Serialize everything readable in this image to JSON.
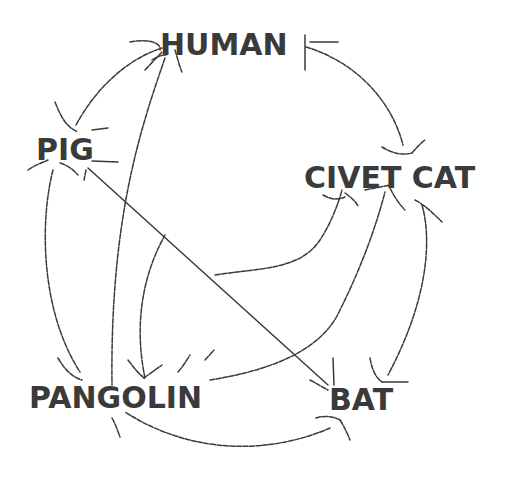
{
  "diagram": {
    "type": "transmission-network",
    "background": "#ffffff",
    "ink_color": "#3a3a3a",
    "nodes": [
      {
        "id": "human",
        "label": "HUMAN"
      },
      {
        "id": "pig",
        "label": "PIG"
      },
      {
        "id": "civet_cat",
        "label": "CIVET CAT"
      },
      {
        "id": "pangolin",
        "label": "PANGOLIN"
      },
      {
        "id": "bat",
        "label": "BAT"
      }
    ],
    "edges": [
      {
        "from": "pig",
        "to": "human",
        "style": "curved-arrow"
      },
      {
        "from": "human",
        "to": "civet_cat",
        "style": "curved-arrow"
      },
      {
        "from": "pangolin",
        "to": "human",
        "style": "curved-arrow"
      },
      {
        "from": "pig",
        "to": "pangolin",
        "style": "curved-arrow"
      },
      {
        "from": "pig",
        "to": "bat",
        "style": "straight-line"
      },
      {
        "from": "civet_cat",
        "to": "bat",
        "style": "curved-arrow"
      },
      {
        "from": "civet_cat",
        "to": "pangolin",
        "style": "curved-arrow"
      },
      {
        "from": "pangolin",
        "to": "civet_cat",
        "style": "curved-arrow"
      },
      {
        "from": "bat",
        "to": "pangolin",
        "style": "curved-arrow"
      }
    ]
  }
}
